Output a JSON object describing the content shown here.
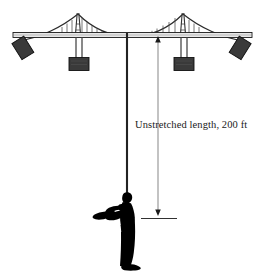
{
  "figure": {
    "background_color": "#ffffff",
    "width": 265,
    "height": 276
  },
  "annotation": {
    "dimension_label": "Unstretched length, 200 ft",
    "quantity": "200",
    "units": "ft",
    "measured_item": "Unstretched length"
  },
  "colors": {
    "line": "#1a1a1a",
    "deck_fill": "#e8e8e8",
    "block_fill": "#3a3a3a",
    "block_stroke": "#111111",
    "cable_stroke": "#2b2b2b",
    "hanger_stroke": "#4a4a4a",
    "tower_stroke": "#333333",
    "person_fill": "#000000",
    "dimension_stroke": "#555555",
    "cord_stroke": "#222222"
  },
  "structure": {
    "deck": {
      "label": "bridge-deck",
      "y": 34,
      "x_left": 13,
      "x_right": 252
    },
    "towers": [
      {
        "label": "left-tower",
        "x": 78,
        "top_y": 13
      },
      {
        "label": "right-tower",
        "x": 183,
        "top_y": 13
      }
    ],
    "suspender_blocks": [
      {
        "label": "left-counterweight",
        "x": 70,
        "y": 58,
        "w": 19,
        "h": 13
      },
      {
        "label": "right-counterweight",
        "x": 175,
        "y": 58,
        "w": 19,
        "h": 13
      }
    ],
    "anchor_blocks": [
      {
        "label": "left-anchor",
        "x": 12,
        "y": 38
      },
      {
        "label": "right-anchor",
        "x": 234,
        "y": 38
      }
    ],
    "bungee_cord": {
      "label": "bungee-cord",
      "x": 127,
      "top_y": 34,
      "bottom_y": 215
    },
    "jumper": {
      "label": "bungee-jumper",
      "x": 95,
      "y": 188
    }
  },
  "dimension_line": {
    "x": 158,
    "top_y": 39,
    "bottom_y": 213,
    "top_arrow": "arrow-up",
    "bottom_arrow": "arrow-down",
    "baseline_tick_y": 217,
    "baseline_tick_x_left": 141,
    "baseline_tick_x_right": 176
  }
}
